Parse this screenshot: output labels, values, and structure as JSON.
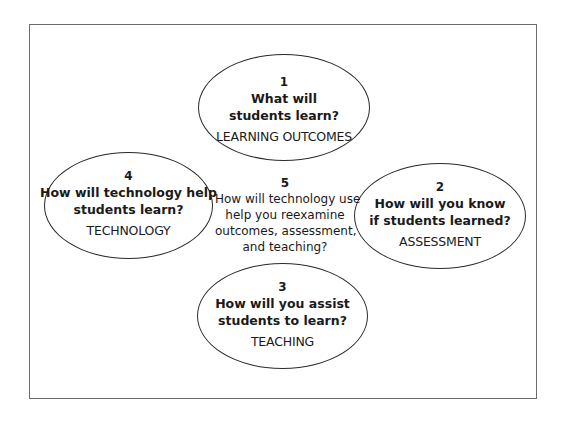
{
  "diagram": {
    "type": "cycle-of-ellipses",
    "colors": {
      "background": "#ffffff",
      "frame_border": "#6b6b6b",
      "ellipse_border": "#2a2a2a",
      "text": "#1a1a1a"
    },
    "nodes": [
      {
        "number": "1",
        "question_lines": [
          "What will",
          "students learn?"
        ],
        "label": "LEARNING OUTCOMES",
        "position": "top"
      },
      {
        "number": "2",
        "question_lines": [
          "How will you know",
          "if students learned?"
        ],
        "label": "ASSESSMENT",
        "position": "right"
      },
      {
        "number": "3",
        "question_lines": [
          "How will you assist",
          "students to learn?"
        ],
        "label": "TEACHING",
        "position": "bottom"
      },
      {
        "number": "4",
        "question_lines": [
          "How will technology help",
          "students learn?"
        ],
        "label": "TECHNOLOGY",
        "position": "left"
      }
    ],
    "center": {
      "number": "5",
      "text_lines": [
        "How will technology use",
        "help you reexamine",
        "outcomes, assessment,",
        "and teaching?"
      ]
    }
  }
}
